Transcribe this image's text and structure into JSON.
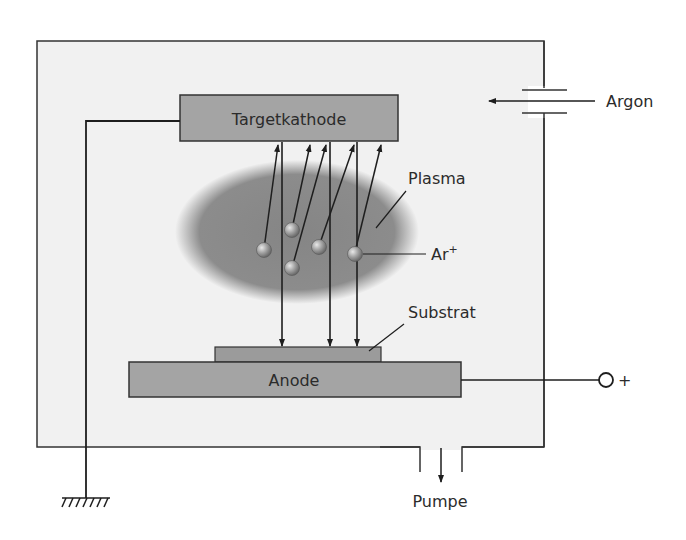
{
  "diagram": {
    "labels": {
      "target": "Targetkathode",
      "gas": "Argon",
      "plasma": "Plasma",
      "ion": "Ar",
      "ion_charge": "+",
      "substrate": "Substrat",
      "anode": "Anode",
      "positive_terminal": "+",
      "pump": "Pumpe"
    },
    "colors": {
      "chamber_fill": "#f1f1f1",
      "box_fill": "#a4a4a4",
      "substrate_fill": "#9b9b9b",
      "plasma_fill": "#8a8a8a",
      "line": "#1e1e1e"
    }
  }
}
